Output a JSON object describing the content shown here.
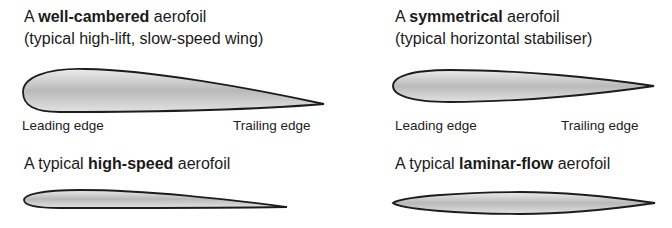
{
  "panels": [
    {
      "id": "well-cambered",
      "title_prefix": "A ",
      "title_bold": "well-cambered",
      "title_suffix": " aerofoil",
      "subtitle": "(typical high-lift, slow-speed wing)",
      "leading_edge_label": "Leading edge",
      "trailing_edge_label": "Trailing edge"
    },
    {
      "id": "symmetrical",
      "title_prefix": "A ",
      "title_bold": "symmetrical",
      "title_suffix": " aerofoil",
      "subtitle": "(typical horizontal stabiliser)",
      "leading_edge_label": "Leading edge",
      "trailing_edge_label": "Trailing edge"
    },
    {
      "id": "high-speed",
      "title_prefix": "A typical ",
      "title_bold": "high-speed",
      "title_suffix": " aerofoil"
    },
    {
      "id": "laminar-flow",
      "title_prefix": "A typical ",
      "title_bold": "laminar-flow",
      "title_suffix": " aerofoil"
    }
  ],
  "style": {
    "outline_color": "#1c1c1c",
    "fill_light": "#e6e6e6",
    "fill_dark": "#b4b4b4"
  }
}
